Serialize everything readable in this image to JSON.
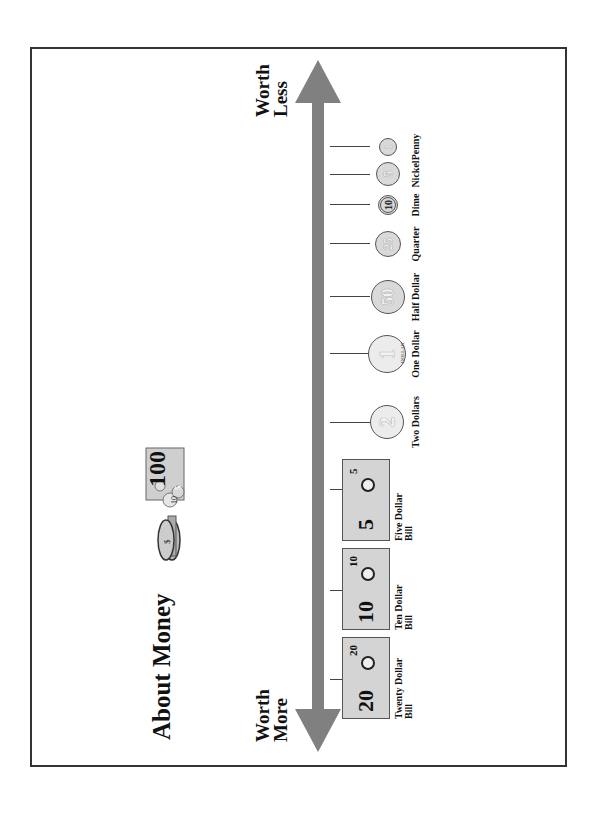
{
  "page": {
    "title": "About Money",
    "orientation": "landscape-rotated-90-ccw"
  },
  "axis": {
    "left_label_line1": "Worth",
    "left_label_line2": "More",
    "right_label_line1": "Worth",
    "right_label_line2": "Less",
    "arrow_color": "#808080"
  },
  "clipart": {
    "bill_value": "100",
    "coin_a": "10",
    "coin_b": "5",
    "icon": "money-stack-icon"
  },
  "bills": [
    {
      "value": "20",
      "corner": "20",
      "label_line1": "Twenty Dollar",
      "label_line2": "Bill"
    },
    {
      "value": "10",
      "corner": "10",
      "label_line1": "Ten Dollar",
      "label_line2": "Bill"
    },
    {
      "value": "5",
      "corner": "5",
      "label_line1": "Five Dollar",
      "label_line2": "Bill"
    }
  ],
  "coins": [
    {
      "value": "2",
      "label": "Two Dollars"
    },
    {
      "value": "1",
      "label": "One Dollar",
      "rim_text": "DOLLAR"
    },
    {
      "value": "50",
      "label": "Half Dollar"
    },
    {
      "value": "25",
      "label": "Quarter"
    },
    {
      "value": "10",
      "label": "Dime"
    },
    {
      "value": "5",
      "label": "Nickel"
    },
    {
      "value": "1",
      "label": "Penny"
    }
  ],
  "colors": {
    "border": "#333333",
    "bill_fill": "#d4d4d4",
    "coin_fill": "#d9d9d9",
    "text": "#111111"
  }
}
